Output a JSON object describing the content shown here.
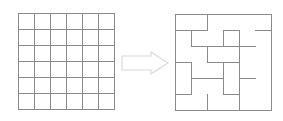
{
  "figure": {
    "background_color": "#ffffff",
    "line_color": "#8a8a8a",
    "arrow_stroke_color": "#d8d8d8",
    "arrow_fill_color": "#ffffff",
    "canvas": {
      "width": 283,
      "height": 121
    }
  },
  "grid_panel": {
    "name": "empty-grid",
    "origin": {
      "x": 18,
      "y": 13
    },
    "cell_size": 16,
    "rows": 6,
    "cols": 6,
    "width": 96,
    "height": 96,
    "interior_vertical_lines_x": [
      34,
      50,
      66,
      82,
      98
    ],
    "interior_horizontal_lines_y": [
      29,
      45,
      61,
      77,
      93
    ]
  },
  "arrow": {
    "name": "transform-arrow",
    "direction": "right",
    "x": 122,
    "y": 52,
    "width": 46,
    "height": 22,
    "shaft_height": 12,
    "head_width": 17,
    "points": "122,56 151,56 151,52 168,63 151,74 151,70 122,70"
  },
  "maze_panel": {
    "name": "generated-maze",
    "origin": {
      "x": 175,
      "y": 14
    },
    "cell_size": 16,
    "rows": 6,
    "cols": 6,
    "width": 96,
    "height": 96,
    "interior_vertical_walls": [
      {
        "col": 2,
        "row": 0
      },
      {
        "col": 3,
        "row": 1
      },
      {
        "col": 1,
        "row": 1
      },
      {
        "col": 4,
        "row": 1
      },
      {
        "col": 2,
        "row": 2
      },
      {
        "col": 4,
        "row": 2
      },
      {
        "col": 1,
        "row": 3
      },
      {
        "col": 3,
        "row": 3
      },
      {
        "col": 4,
        "row": 3
      },
      {
        "col": 1,
        "row": 4
      },
      {
        "col": 3,
        "row": 4
      },
      {
        "col": 4,
        "row": 4
      },
      {
        "col": 2,
        "row": 5
      },
      {
        "col": 4,
        "row": 5
      }
    ],
    "interior_horizontal_walls": [
      {
        "col": 0,
        "row": 1
      },
      {
        "col": 1,
        "row": 1
      },
      {
        "col": 3,
        "row": 1
      },
      {
        "col": 5,
        "row": 1
      },
      {
        "col": 1,
        "row": 2
      },
      {
        "col": 2,
        "row": 2
      },
      {
        "col": 3,
        "row": 2
      },
      {
        "col": 4,
        "row": 2
      },
      {
        "col": 0,
        "row": 3
      },
      {
        "col": 2,
        "row": 3
      },
      {
        "col": 3,
        "row": 3
      },
      {
        "col": 1,
        "row": 4
      },
      {
        "col": 2,
        "row": 4
      },
      {
        "col": 4,
        "row": 4
      },
      {
        "col": 0,
        "row": 5
      },
      {
        "col": 3,
        "row": 5
      }
    ]
  }
}
